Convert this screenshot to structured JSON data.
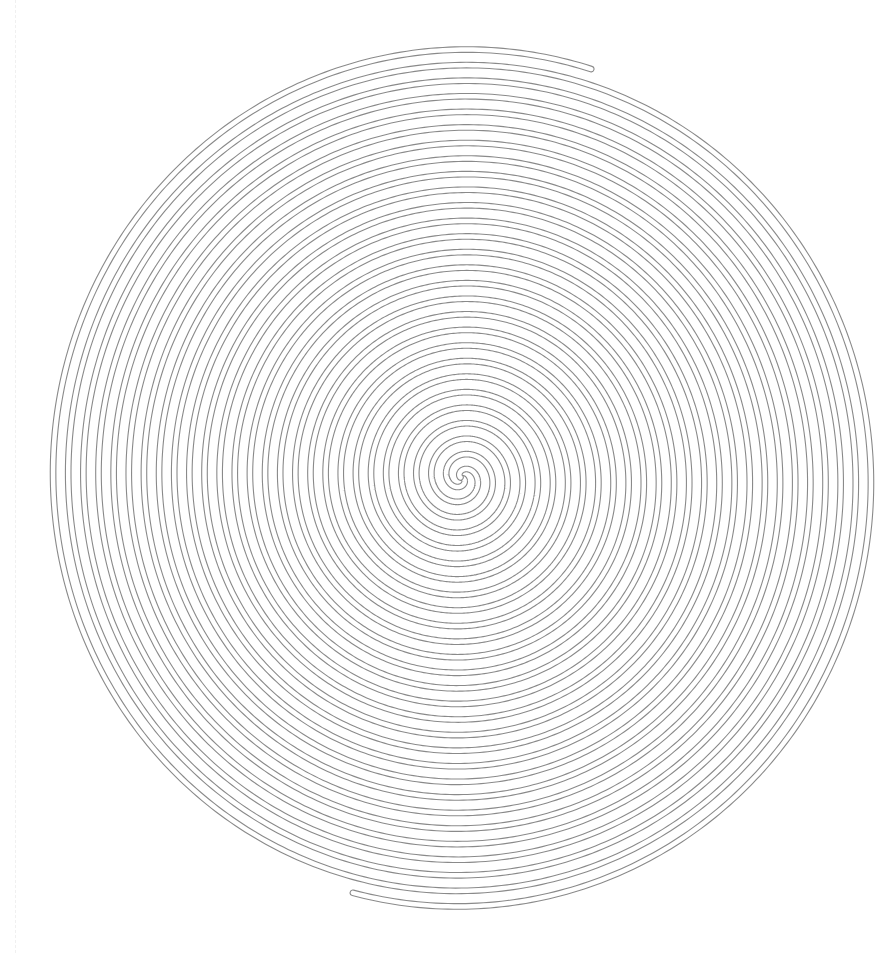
{
  "figure": {
    "stroke_color": "#8a8a8a",
    "background": "#ffffff",
    "center": [
      462,
      478
    ],
    "outer_radius_x": 418,
    "outer_radius_y": 430,
    "turns": 13.8,
    "tube_width": 4.5,
    "outline_width": 1.1,
    "arms": 2
  }
}
